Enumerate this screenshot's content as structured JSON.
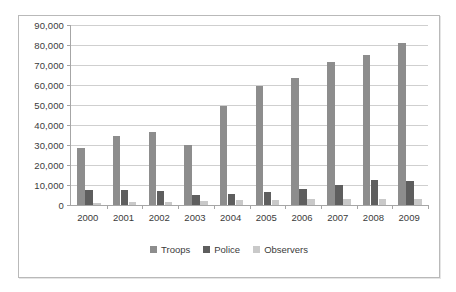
{
  "chart_data": {
    "type": "bar",
    "title": "",
    "subtitle": "",
    "xlabel": "",
    "ylabel": "",
    "categories": [
      "2000",
      "2001",
      "2002",
      "2003",
      "2004",
      "2005",
      "2006",
      "2007",
      "2008",
      "2009"
    ],
    "series": [
      {
        "name": "Troops",
        "color": "#8d8d8d",
        "values": [
          28700,
          34700,
          36500,
          30200,
          49300,
          59400,
          63400,
          71700,
          75100,
          81100
        ]
      },
      {
        "name": "Police",
        "color": "#5e5e5e",
        "values": [
          7400,
          7500,
          7000,
          4800,
          5600,
          6300,
          7800,
          10200,
          12500,
          12100
        ]
      },
      {
        "name": "Observers",
        "color": "#c9c9c9",
        "values": [
          1200,
          1500,
          1600,
          1800,
          2300,
          2400,
          2800,
          3200,
          3200,
          3200
        ]
      }
    ],
    "ylim": [
      0,
      90000
    ],
    "ytick_step": 10000,
    "ytick_labels": [
      "0",
      "10,000",
      "20,000",
      "30,000",
      "40,000",
      "50,000",
      "60,000",
      "70,000",
      "80,000",
      "90,000"
    ],
    "grid": true,
    "grid_axis": "y",
    "legend_position": "bottom",
    "legend": [
      "Troops",
      "Police",
      "Observers"
    ]
  },
  "frame": {
    "border_color": "#b9b9b9",
    "background": "#ffffff"
  },
  "axis": {
    "line_color": "#a6a6a6",
    "gridline_color": "#cfcfcf",
    "tick_text_color": "#3b3b3b"
  }
}
